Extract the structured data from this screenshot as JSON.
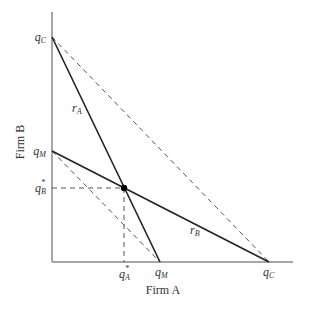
{
  "figure": {
    "type": "diagram",
    "x_axis_label": "Firm A",
    "y_axis_label": "Firm B",
    "y_ticks": {
      "qC": {
        "base": "q",
        "sub": "C"
      },
      "qM": {
        "base": "q",
        "sub": "M"
      },
      "qBstar": {
        "base": "q",
        "sub": "B",
        "sup": "*"
      }
    },
    "x_ticks": {
      "qAstar": {
        "base": "q",
        "sub": "A",
        "sup": "*"
      },
      "qM": {
        "base": "q",
        "sub": "M"
      },
      "qC": {
        "base": "q",
        "sub": "C"
      }
    },
    "curves": {
      "rA": {
        "base": "r",
        "sub": "A"
      },
      "rB": {
        "base": "r",
        "sub": "B"
      }
    },
    "colors": {
      "axis": "#888888",
      "line": "#222222",
      "dashed": "#555555",
      "point": "#000000"
    }
  }
}
